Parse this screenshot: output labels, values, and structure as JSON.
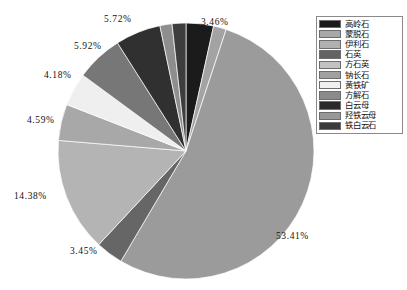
{
  "chart_data": {
    "type": "pie",
    "title": "",
    "subtitle": "",
    "xlabel": "",
    "ylabel": "",
    "grid": false,
    "legend_position": "right",
    "start_angle_deg": 0,
    "direction": "clockwise",
    "categories": [
      "高岭石",
      "蒙脱石",
      "伊利石",
      "石英",
      "方石英",
      "钠长石",
      "黄铁矿",
      "方解石",
      "白云母",
      "羟铁云母",
      "铁白云石"
    ],
    "values": [
      3.46,
      1.62,
      53.41,
      3.45,
      14.38,
      4.59,
      4.18,
      5.92,
      5.72,
      1.53,
      1.74
    ],
    "colors": [
      "#1b1b1b",
      "#a3a3a3",
      "#9b9b9b",
      "#666666",
      "#b4b4b4",
      "#a8a8a8",
      "#efefef",
      "#777777",
      "#303030",
      "#8e8e8e",
      "#3d3d3d"
    ],
    "visible_labels": [
      {
        "text": "3.46%",
        "value": 3.46
      },
      {
        "text": "53.41%",
        "value": 53.41
      },
      {
        "text": "3.45%",
        "value": 3.45
      },
      {
        "text": "14.38%",
        "value": 14.38
      },
      {
        "text": "4.59%",
        "value": 4.59
      },
      {
        "text": "4.18%",
        "value": 4.18
      },
      {
        "text": "5.92%",
        "value": 5.92
      },
      {
        "text": "5.72%",
        "value": 5.72
      }
    ]
  },
  "legend": {
    "items": [
      {
        "label": "高岭石",
        "color": "#1b1b1b"
      },
      {
        "label": "蒙脱石",
        "color": "#a8a8a8"
      },
      {
        "label": "伊利石",
        "color": "#b0b0b0"
      },
      {
        "label": "石英",
        "color": "#636363"
      },
      {
        "label": "方石英",
        "color": "#c2c2c2"
      },
      {
        "label": "钠长石",
        "color": "#a0a0a0"
      },
      {
        "label": "黄铁矿",
        "color": "#f0f0f0"
      },
      {
        "label": "方解石",
        "color": "#8b8b8b"
      },
      {
        "label": "白云母",
        "color": "#2a2a2a"
      },
      {
        "label": "羟铁云母",
        "color": "#989898"
      },
      {
        "label": "铁白云石",
        "color": "#3a3a3a"
      }
    ]
  },
  "labels": {
    "top_left": "5.72%",
    "top_right": "3.46%",
    "upper_left": "5.92%",
    "left_upper": "4.18%",
    "left_mid": "4.59%",
    "left_lower": "14.38%",
    "bottom_left": "3.45%",
    "bottom_right": "53.41%"
  }
}
